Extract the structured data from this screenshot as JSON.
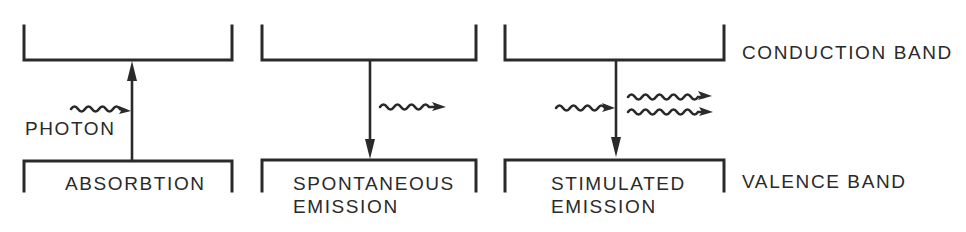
{
  "diagram": {
    "side_labels": {
      "conduction_band": "CONDUCTION BAND",
      "valence_band": "VALENCE BAND"
    },
    "panels": [
      {
        "id": "absorption",
        "caption_line1": "ABSORBTION",
        "caption_line2": "",
        "photon_label": "PHOTON",
        "transition_direction": "up",
        "incoming_photons": 1,
        "outgoing_photons": 0
      },
      {
        "id": "spontaneous-emission",
        "caption_line1": "SPONTANEOUS",
        "caption_line2": "EMISSION",
        "transition_direction": "down",
        "incoming_photons": 0,
        "outgoing_photons": 1
      },
      {
        "id": "stimulated-emission",
        "caption_line1": "STIMULATED",
        "caption_line2": "EMISSION",
        "transition_direction": "down",
        "incoming_photons": 1,
        "outgoing_photons": 2
      }
    ],
    "colors": {
      "ink": "#2a2a2a",
      "background": "#ffffff"
    }
  }
}
